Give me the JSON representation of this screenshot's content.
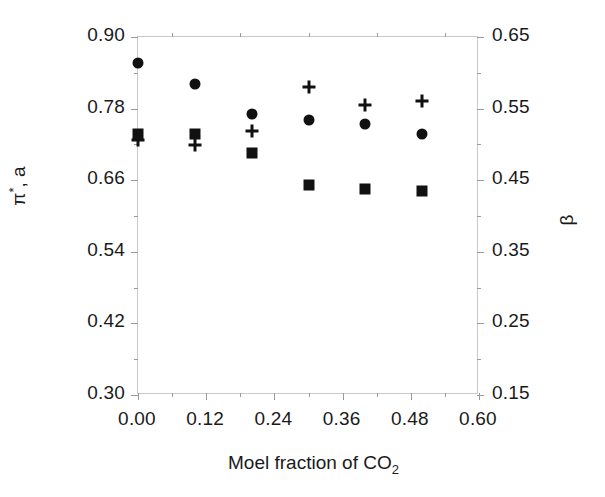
{
  "chart_data": {
    "type": "scatter",
    "title": "",
    "xlabel": "Moel fraction of CO2",
    "xlabel_parts": {
      "text": "Moel fraction of CO",
      "sub": "2"
    },
    "ylabel_left": "π*, a",
    "ylabel_left_parts": {
      "pi": "π",
      "star": "*",
      "rest": ", a"
    },
    "ylabel_right": "β",
    "xlim": [
      0.0,
      0.6
    ],
    "ylim_left": [
      0.3,
      0.9
    ],
    "ylim_right": [
      0.15,
      0.65
    ],
    "xticks": [
      "0.00",
      "0.12",
      "0.24",
      "0.36",
      "0.48",
      "0.60"
    ],
    "xtick_values": [
      0.0,
      0.12,
      0.24,
      0.36,
      0.48,
      0.6
    ],
    "yticks_left": [
      "0.90",
      "0.78",
      "0.66",
      "0.54",
      "0.42",
      "0.30"
    ],
    "ytick_left_values": [
      0.9,
      0.78,
      0.66,
      0.54,
      0.42,
      0.3
    ],
    "yticks_right": [
      "0.65",
      "0.55",
      "0.45",
      "0.35",
      "0.25",
      "0.15"
    ],
    "ytick_right_values": [
      0.65,
      0.55,
      0.45,
      0.35,
      0.25,
      0.15
    ],
    "grid": false,
    "legend": null,
    "x": [
      0.0,
      0.1,
      0.2,
      0.3,
      0.4,
      0.5
    ],
    "series": [
      {
        "name": "π*",
        "marker": "circle",
        "axis": "left",
        "values": [
          0.856,
          0.821,
          0.771,
          0.761,
          0.754,
          0.738
        ]
      },
      {
        "name": "a",
        "marker": "square",
        "axis": "left",
        "values": [
          0.738,
          0.738,
          0.706,
          0.652,
          0.645,
          0.642
        ]
      },
      {
        "name": "β",
        "marker": "plus",
        "axis": "left",
        "values": [
          0.727,
          0.719,
          0.742,
          0.816,
          0.786,
          0.793
        ]
      }
    ]
  },
  "figure": {
    "axis_color": "#c9c9c9",
    "tick_color": "#9a9a9a",
    "marker_color": "#111111",
    "text_color": "#1a1a1a",
    "background": "#ffffff"
  }
}
